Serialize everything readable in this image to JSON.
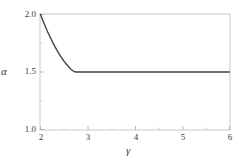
{
  "chart_data": {
    "type": "line",
    "title": "",
    "subtitle": "",
    "xlabel": "γ",
    "ylabel": "α",
    "xlim": [
      2,
      6
    ],
    "ylim": [
      1.0,
      2.0
    ],
    "xticks": [
      2,
      3,
      4,
      5,
      6
    ],
    "xtick_labels": [
      "2",
      "3",
      "4",
      "5",
      "6"
    ],
    "yticks": [
      1.0,
      1.5,
      2.0
    ],
    "ytick_labels": [
      "1.0",
      "1.5",
      "2.0"
    ],
    "minor_xticks": [
      2.5,
      3.5,
      4.5,
      5.5
    ],
    "minor_yticks": [
      1.25,
      1.75
    ],
    "grid": false,
    "legend": null,
    "annotations": [],
    "series": [
      {
        "name": "alpha(gamma)",
        "color": "#4a3f52",
        "linewidth": 1.4,
        "x": [
          2.0,
          2.05,
          2.1,
          2.15,
          2.2,
          2.25,
          2.3,
          2.35,
          2.4,
          2.45,
          2.5,
          2.55,
          2.6,
          2.65,
          2.7,
          2.75,
          2.8,
          2.85,
          2.9,
          2.95,
          3.0,
          3.25,
          3.5,
          3.75,
          4.0,
          4.25,
          4.5,
          4.75,
          5.0,
          5.25,
          5.5,
          5.75,
          6.0
        ],
        "values": [
          2.0,
          1.947,
          1.897,
          1.85,
          1.806,
          1.764,
          1.725,
          1.688,
          1.654,
          1.622,
          1.593,
          1.567,
          1.543,
          1.522,
          1.506,
          1.5,
          1.5,
          1.5,
          1.5,
          1.5,
          1.5,
          1.5,
          1.5,
          1.5,
          1.5,
          1.5,
          1.5,
          1.5,
          1.5,
          1.5,
          1.5,
          1.5,
          1.5
        ]
      }
    ]
  },
  "axes": {
    "frame_color": "#c9c9c9",
    "tick_color": "#bdbdbd",
    "background": "#ffffff"
  },
  "labels": {
    "y_top": "2.0",
    "y_mid": "1.5",
    "y_bottom": "1.0",
    "x1": "2",
    "x2": "3",
    "x3": "4",
    "x4": "5",
    "x5": "6",
    "y_axis_name": "α",
    "x_axis_name": "γ"
  }
}
